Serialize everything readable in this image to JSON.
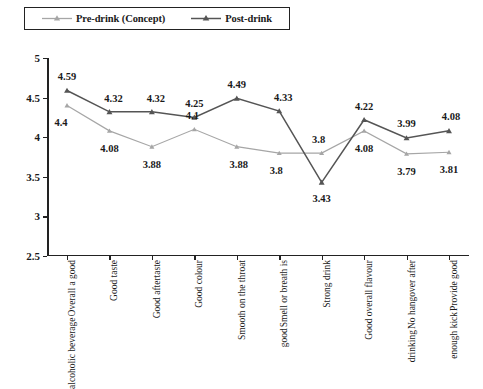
{
  "chart_data": {
    "type": "line",
    "title": "",
    "subtitle": "",
    "xlabel": "",
    "ylabel": "",
    "ylim": [
      2.5,
      5
    ],
    "y_ticks": [
      "2.5",
      "3",
      "3.5",
      "4",
      "4.5",
      "5"
    ],
    "grid": false,
    "legend_position": "top-left",
    "categories": [
      "Overall a good alcoholic beverage",
      "Good taste",
      "Good aftertaste",
      "Good colour",
      "Smooth on the throat",
      "Smell or breath is good",
      "Strong drink",
      "Good overall flavour",
      "No hangover after drinking",
      "Provide good enough kick"
    ],
    "category_lines": [
      [
        "Overall a good",
        "alcoholic beverage"
      ],
      [
        "Good taste"
      ],
      [
        "Good aftertaste"
      ],
      [
        "Good colour"
      ],
      [
        "Smooth on the throat"
      ],
      [
        "Smell or breath is",
        "good"
      ],
      [
        "Strong drink"
      ],
      [
        "Good overall flavour"
      ],
      [
        "No hangover after",
        "drinking"
      ],
      [
        "Provide good",
        "enough kick"
      ]
    ],
    "series": [
      {
        "name": "Pre-drink (Concept)",
        "color": "#a6a6a6",
        "marker": "triangle",
        "values": [
          4.4,
          4.08,
          3.88,
          4.1,
          3.88,
          3.8,
          3.8,
          4.08,
          3.79,
          3.81
        ],
        "labels": [
          "4.4",
          "4.08",
          "3.88",
          "4.1",
          "3.88",
          "3.8",
          "3.8",
          "4.08",
          "3.79",
          "3.81"
        ]
      },
      {
        "name": "Post-drink",
        "color": "#555555",
        "marker": "triangle",
        "values": [
          4.59,
          4.32,
          4.32,
          4.25,
          4.49,
          4.33,
          3.43,
          4.22,
          3.99,
          4.08
        ],
        "labels": [
          "4.59",
          "4.32",
          "4.32",
          "4.25",
          "4.49",
          "4.33",
          "3.43",
          "4.22",
          "3.99",
          "4.08"
        ]
      }
    ]
  },
  "legend": {
    "entries": [
      {
        "label": "Pre-drink (Concept)",
        "color": "#a6a6a6"
      },
      {
        "label": "Post-drink",
        "color": "#555555"
      }
    ]
  }
}
